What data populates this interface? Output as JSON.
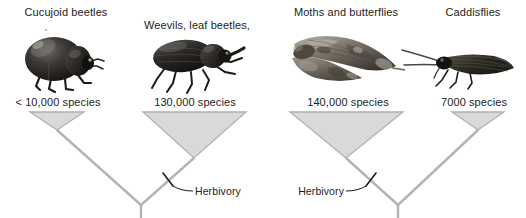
{
  "figure": {
    "type": "phylogeny-comparison",
    "background": "#ffffff",
    "line_color": "#b4b4b4",
    "wedge_fill": "#d9d9d9",
    "wedge_stroke": "#b0b0b0",
    "leader_color": "#1a1a1a"
  },
  "panels": [
    {
      "id": "beetles",
      "clades": [
        {
          "name": "Cucujoid beetles",
          "label": "Cucujoid beetles",
          "count_label": "< 10,000 species",
          "species_count": 10000,
          "count_qualifier": "<",
          "herbivorous": false,
          "photo": "beetle-cucujoid-photo",
          "wedge": {
            "left": 30,
            "right": 84,
            "top": 112,
            "apex_x": 57,
            "apex_y": 130
          }
        },
        {
          "name": "Weevils, leaf beetles, and kin",
          "label": "Weevils, leaf beetles,\nand kin",
          "count_label": "130,000 species",
          "species_count": 130000,
          "count_qualifier": "",
          "herbivorous": true,
          "photo": "weevil-photo",
          "wedge": {
            "left": 143,
            "right": 246,
            "top": 112,
            "apex_x": 194,
            "apex_y": 158
          }
        }
      ],
      "annotation": {
        "label": "Herbivory",
        "x": 196,
        "y": 173,
        "align": "left"
      },
      "root": {
        "x": 141,
        "y": 205,
        "stem_bottom": 218
      }
    },
    {
      "id": "lepidoptera",
      "clades": [
        {
          "name": "Moths and butterflies",
          "label": "Moths and butterflies",
          "count_label": "140,000 species",
          "species_count": 140000,
          "count_qualifier": "",
          "herbivorous": true,
          "photo": "moth-photo",
          "wedge": {
            "left": 290,
            "right": 403,
            "top": 112,
            "apex_x": 346,
            "apex_y": 158
          }
        },
        {
          "name": "Caddisflies",
          "label": "Caddisflies",
          "count_label": "7000 species",
          "species_count": 7000,
          "count_qualifier": "",
          "herbivorous": false,
          "photo": "caddisfly-photo",
          "wedge": {
            "left": 452,
            "right": 504,
            "top": 112,
            "apex_x": 478,
            "apex_y": 130
          }
        }
      ],
      "annotation": {
        "label": "Herbivory",
        "x": 290,
        "y": 173,
        "align": "right"
      },
      "root": {
        "x": 398,
        "y": 205,
        "stem_bottom": 218
      }
    }
  ],
  "headings": {
    "cucujoid": "Cucujoid beetles",
    "weevils_line1": "Weevils, leaf beetles,",
    "weevils_line2": "and kin",
    "moths": "Moths and butterflies",
    "caddisflies": "Caddisflies"
  },
  "counts": {
    "cucujoid": "< 10,000 species",
    "weevils": "130,000 species",
    "moths": "140,000 species",
    "caddisflies": "7000 species"
  },
  "annotations": {
    "herbivory_left": "Herbivory",
    "herbivory_right": "Herbivory"
  }
}
